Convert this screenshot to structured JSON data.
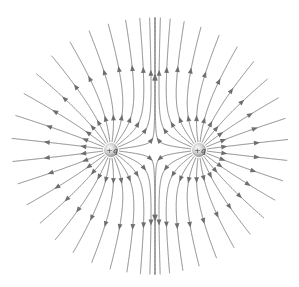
{
  "diagram": {
    "width": 299,
    "height": 287,
    "line_color": "#7d7d7d",
    "arrow_color": "#6e6e6e",
    "background": "#ffffff",
    "lines_per_charge": 24,
    "boundary": {
      "cx": 150,
      "cy": 146,
      "rx": 138,
      "ry": 128
    },
    "charges": [
      {
        "id": "left",
        "label": "+q",
        "x": 111,
        "y": 150,
        "q": 1
      },
      {
        "id": "right",
        "label": "+q",
        "x": 199,
        "y": 150,
        "q": 1
      }
    ]
  }
}
